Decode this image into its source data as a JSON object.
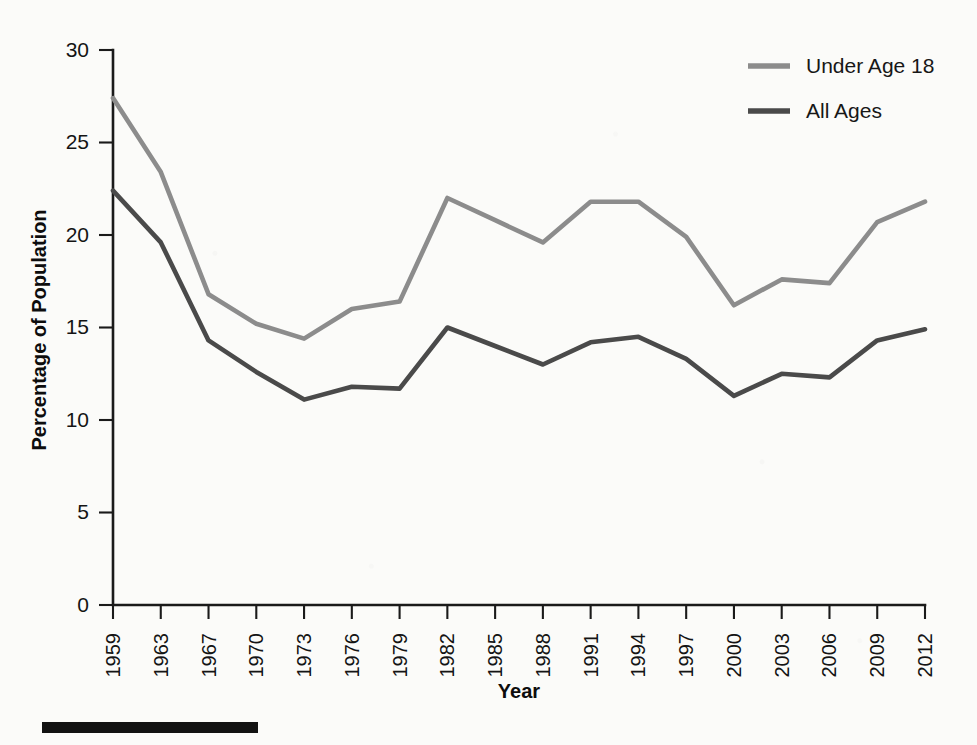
{
  "chart_data": {
    "type": "line",
    "title": "",
    "xlabel": "Year",
    "ylabel": "Percentage of Population",
    "xlim": [
      1959,
      2012
    ],
    "ylim": [
      0,
      30
    ],
    "ytick_labels": [
      "0",
      "5",
      "10",
      "15",
      "20",
      "25",
      "30"
    ],
    "ytick_values": [
      0,
      5,
      10,
      15,
      20,
      25,
      30
    ],
    "grid": false,
    "legend_position": "top-right",
    "categories": [
      1959,
      1963,
      1967,
      1970,
      1973,
      1976,
      1979,
      1982,
      1985,
      1988,
      1991,
      1994,
      1997,
      2000,
      2003,
      2006,
      2009,
      2012
    ],
    "xtick_labels": [
      "1959",
      "1963",
      "1967",
      "1970",
      "1973",
      "1976",
      "1979",
      "1982",
      "1985",
      "1988",
      "1991",
      "1994",
      "1997",
      "2000",
      "2003",
      "2006",
      "2009",
      "2012"
    ],
    "series": [
      {
        "name": "Under Age 18",
        "color": "#8c8c8c",
        "values": [
          27.4,
          23.4,
          16.8,
          15.2,
          14.4,
          16.0,
          16.4,
          22.0,
          20.8,
          19.6,
          21.8,
          21.8,
          19.9,
          16.2,
          17.6,
          17.4,
          20.7,
          21.8
        ]
      },
      {
        "name": "All Ages",
        "color": "#4a4a4a",
        "values": [
          22.4,
          19.6,
          14.3,
          12.6,
          11.1,
          11.8,
          11.7,
          15.0,
          14.0,
          13.0,
          14.2,
          14.5,
          13.3,
          11.3,
          12.5,
          12.3,
          14.3,
          14.9
        ]
      }
    ]
  },
  "legend": {
    "items": [
      {
        "label": "Under Age 18",
        "color": "#8c8c8c"
      },
      {
        "label": "All Ages",
        "color": "#4a4a4a"
      }
    ]
  },
  "axes": {
    "y_title": "Percentage of Population",
    "x_title": "Year"
  },
  "colors": {
    "under18": "#8c8c8c",
    "all_ages": "#4a4a4a",
    "axis": "#1a1a1a",
    "background": "#fbfbf9"
  }
}
